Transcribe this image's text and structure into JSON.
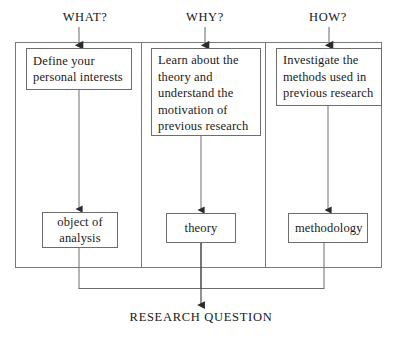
{
  "diagram": {
    "title": "RESEARCH QUESTION",
    "columns": [
      {
        "header": "WHAT?",
        "action_lines": [
          "Define your",
          "personal interests"
        ],
        "result": "object of analysis",
        "result_lines": [
          "object of",
          "analysis"
        ]
      },
      {
        "header": "WHY?",
        "action_lines": [
          "Learn about the",
          "theory and",
          "understand the",
          "motivation of",
          "previous research"
        ],
        "result": "theory",
        "result_lines": [
          "theory"
        ]
      },
      {
        "header": "HOW?",
        "action_lines": [
          "Investigate the",
          "methods used in",
          "previous research"
        ],
        "result": "methodology",
        "result_lines": [
          "methodology"
        ]
      }
    ],
    "colors": {
      "stroke": "#6d6d6d",
      "arrow": "#3d3d3d",
      "text": "#171717",
      "background": "#ffffff"
    }
  }
}
